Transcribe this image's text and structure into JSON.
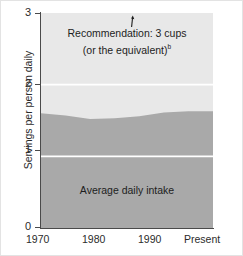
{
  "chart_data": {
    "type": "area",
    "title": "",
    "subtitle": "",
    "xlabel": "",
    "ylabel": "Servings per person daily",
    "ylim": [
      0,
      3
    ],
    "y_ticks": [
      {
        "value": 3,
        "label": "3"
      },
      {
        "value": 2,
        "label": "2"
      },
      {
        "value": 1,
        "label": "1"
      },
      {
        "value": 0,
        "label": "0"
      }
    ],
    "x_ticks": [
      {
        "value": 1970,
        "label": "1970"
      },
      {
        "value": 1980,
        "label": "1980"
      },
      {
        "value": 1990,
        "label": "1990"
      },
      {
        "value": 2005,
        "label": "Present"
      }
    ],
    "grid": "horizontal-white-gridlines-at-1-and-2",
    "legend": "inline-labels",
    "x": [
      1970,
      1975,
      1980,
      1985,
      1990,
      1995,
      2000,
      2005
    ],
    "series": [
      {
        "name": "Average daily intake",
        "color": "#a9a9a9",
        "values": [
          1.6,
          1.57,
          1.52,
          1.53,
          1.56,
          1.61,
          1.63,
          1.63
        ]
      },
      {
        "name": "Recommendation: 3 cups (or the equivalent)",
        "color": "#e8e8e8",
        "values": [
          3.0,
          3.0,
          3.0,
          3.0,
          3.0,
          3.0,
          3.0,
          3.0
        ]
      }
    ],
    "annotations": [
      {
        "name": "recommendation-label",
        "line1": "Recommendation: 3 cups",
        "line2": "(or the equivalent)",
        "footnote_marker": "b",
        "arrow": "up-arrow-icon"
      },
      {
        "name": "intake-label",
        "line1": "Average daily intake"
      }
    ]
  },
  "axes": {
    "y_title": "Servings per person daily",
    "y_tick_labels": [
      "3",
      "2",
      "1",
      "0"
    ],
    "x_tick_labels": [
      "1970",
      "1980",
      "1990",
      "Present"
    ]
  },
  "labels": {
    "recommendation_line1": "Recommendation: 3 cups",
    "recommendation_line2": "(or the equivalent)",
    "recommendation_footnote": "b",
    "intake": "Average daily intake"
  },
  "colors": {
    "recommendation_band": "#e8e8e8",
    "intake_band": "#a9a9a9",
    "gridline": "#ffffff",
    "axis": "#4a4a4a",
    "text": "#1d1d1d",
    "background": "#ffffff"
  }
}
